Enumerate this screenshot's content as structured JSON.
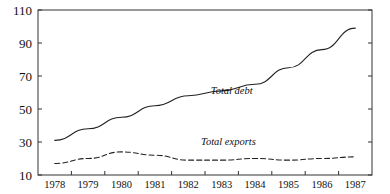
{
  "chart_data": {
    "type": "line",
    "title": "",
    "subtitle": "",
    "xlabel": "",
    "ylabel": "",
    "xlim": [
      1977.5,
      1987.5
    ],
    "ylim": [
      10,
      110
    ],
    "grid": false,
    "legend_position": "inline-annotation",
    "x": [
      1978,
      1979,
      1980,
      1981,
      1982,
      1983,
      1984,
      1985,
      1986,
      1987
    ],
    "xtick_labels": [
      "1978",
      "1979",
      "1980",
      "1981",
      "1982",
      "1983",
      "1984",
      "1985",
      "1986",
      "1987"
    ],
    "ytick_labels": [
      "10",
      "30",
      "50",
      "70",
      "90",
      "110"
    ],
    "yticks": [
      10,
      30,
      50,
      70,
      90,
      110
    ],
    "series": [
      {
        "name": "Total debt",
        "style": "solid",
        "color": "#222222",
        "values": [
          31,
          38,
          45,
          52,
          58,
          61,
          65,
          75,
          86,
          99
        ],
        "annotation": "Total debt"
      },
      {
        "name": "Total exports",
        "style": "dashed",
        "color": "#222222",
        "values": [
          17,
          20,
          24,
          22,
          19,
          19,
          20,
          19,
          20,
          21
        ],
        "annotation": "Total exports"
      }
    ],
    "annotations": [
      {
        "text": "Total debt",
        "x": 1983.3,
        "y": 59
      },
      {
        "text": "Total exports",
        "x": 1983.2,
        "y": 28
      }
    ]
  },
  "colors": {
    "background": "#ffffff",
    "axis": "#333333",
    "series_debt": "#222222",
    "series_exports": "#222222"
  }
}
